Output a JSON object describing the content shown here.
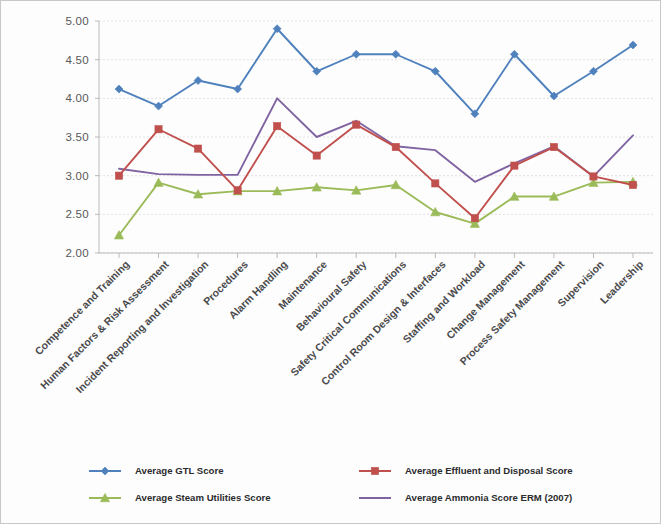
{
  "figure": {
    "background_color": "#fdfdfd",
    "border_color": "#c8c8c8"
  },
  "axis": {
    "y_tick_labels": [
      "5.00",
      "4.50",
      "4.00",
      "3.50",
      "3.00",
      "2.50",
      "2.00"
    ],
    "y_min": 2.0,
    "y_max": 5.0,
    "y_step": 0.5
  },
  "legend": {
    "entries": [
      {
        "label": "Average GTL Score",
        "color": "#4f81bd",
        "marker": "diamond"
      },
      {
        "label": "Average Effluent and Disposal Score",
        "color": "#c0504d",
        "marker": "square"
      },
      {
        "label": "Average Steam Utilities Score",
        "color": "#9bbb59",
        "marker": "triangle"
      },
      {
        "label": "Average Ammonia Score ERM (2007)",
        "color": "#8064a2",
        "marker": "line"
      }
    ]
  },
  "chart_data": {
    "type": "line",
    "title": "",
    "xlabel": "",
    "ylabel": "",
    "ylim": [
      2.0,
      5.0
    ],
    "ytick_step": 0.5,
    "grid": true,
    "legend_position": "bottom",
    "categories": [
      "Competence and Training",
      "Human Factors & Risk Assessment",
      "Incident Reporting and Investigation",
      "Procedures",
      "Alarm Handling",
      "Maintenance",
      "Behavioural Safety",
      "Safety Critical Communications",
      "Control Room Design & Interfaces",
      "Staffing and Workload",
      "Change Management",
      "Process Safety Management",
      "Supervision",
      "Leadership"
    ],
    "series": [
      {
        "name": "Average GTL Score",
        "color": "#4f81bd",
        "marker": "diamond",
        "values": [
          4.12,
          3.9,
          4.23,
          4.12,
          4.9,
          4.35,
          4.57,
          4.57,
          4.35,
          3.8,
          4.57,
          4.03,
          4.35,
          4.69
        ]
      },
      {
        "name": "Average Effluent and Disposal Score",
        "color": "#c0504d",
        "marker": "square",
        "values": [
          3.0,
          3.6,
          3.35,
          2.81,
          3.64,
          3.26,
          3.66,
          3.37,
          2.9,
          2.45,
          3.13,
          3.37,
          2.99,
          2.88
        ]
      },
      {
        "name": "Average Steam Utilities Score",
        "color": "#9bbb59",
        "marker": "triangle",
        "values": [
          2.23,
          2.91,
          2.76,
          2.8,
          2.8,
          2.85,
          2.81,
          2.88,
          2.53,
          2.38,
          2.73,
          2.73,
          2.91,
          2.92
        ]
      },
      {
        "name": "Average Ammonia Score ERM (2007)",
        "color": "#8064a2",
        "marker": "line",
        "values": [
          3.09,
          3.02,
          3.01,
          3.01,
          4.0,
          3.5,
          3.71,
          3.38,
          3.33,
          2.92,
          3.16,
          3.38,
          2.99,
          3.52
        ]
      }
    ]
  }
}
